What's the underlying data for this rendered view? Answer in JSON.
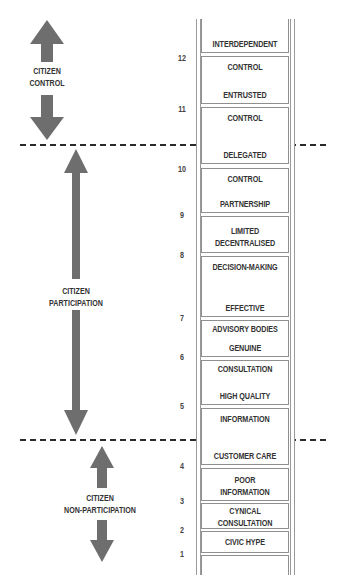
{
  "colors": {
    "arrow": "#6e6e6e",
    "text": "#333333",
    "rail": "#9a9a9a",
    "dash": "#2a2a2a"
  },
  "groups": [
    {
      "id": "citizen-control",
      "lines": [
        "CITIZEN",
        "CONTROL"
      ]
    },
    {
      "id": "citizen-participation",
      "lines": [
        "CITIZEN",
        "PARTICIPATION"
      ]
    },
    {
      "id": "citizen-non-participation",
      "lines": [
        "CITIZEN",
        "NON-PARTICIPATION"
      ]
    }
  ],
  "rung_numbers": [
    "12",
    "11",
    "10",
    "9",
    "8",
    "7",
    "6",
    "5",
    "4",
    "3",
    "2",
    "1"
  ],
  "boxes": [
    {
      "texts": [
        "INTERDEPENDENT"
      ]
    },
    {
      "texts": [
        "CONTROL",
        "ENTRUSTED"
      ]
    },
    {
      "texts": [
        "CONTROL",
        "DELEGATED"
      ]
    },
    {
      "texts": [
        "CONTROL",
        "PARTNERSHIP"
      ]
    },
    {
      "texts": [
        "LIMITED",
        "DECENTRALISED"
      ]
    },
    {
      "texts": [
        "DECISION-MAKING",
        "EFFECTIVE"
      ]
    },
    {
      "texts": [
        "ADVISORY BODIES",
        "GENUINE"
      ]
    },
    {
      "texts": [
        "CONSULTATION",
        "HIGH QUALITY"
      ]
    },
    {
      "texts": [
        "INFORMATION",
        "CUSTOMER CARE"
      ]
    },
    {
      "texts": [
        "POOR",
        "INFORMATION"
      ]
    },
    {
      "texts": [
        "CYNICAL",
        "CONSULTATION"
      ]
    },
    {
      "texts": [
        "CIVIC HYPE"
      ]
    },
    {
      "texts": []
    }
  ]
}
